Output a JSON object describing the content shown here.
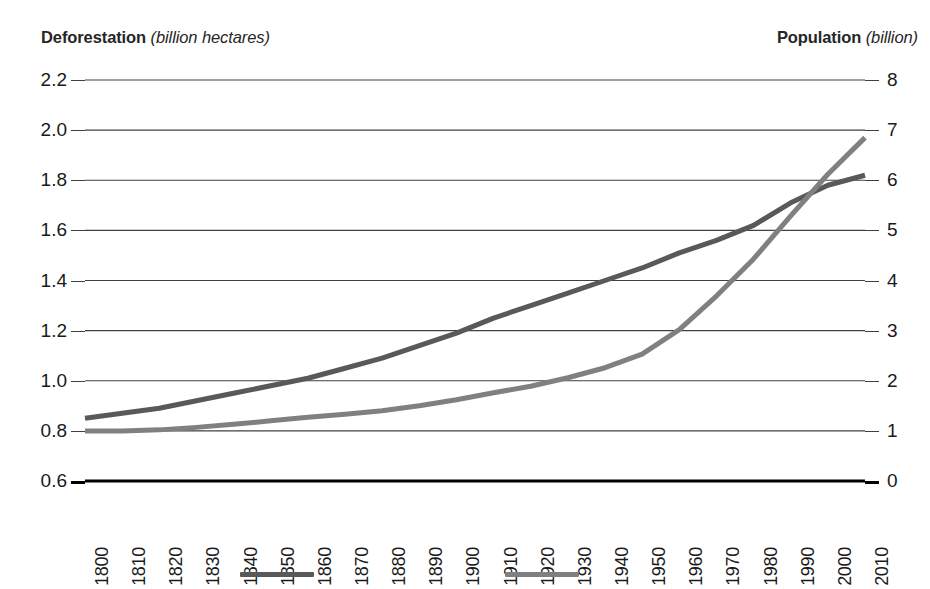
{
  "chart_data": {
    "type": "line",
    "title": "",
    "x": [
      1800,
      1810,
      1820,
      1830,
      1840,
      1850,
      1860,
      1870,
      1880,
      1890,
      1900,
      1910,
      1920,
      1930,
      1940,
      1950,
      1960,
      1970,
      1980,
      1990,
      2000,
      2010
    ],
    "categories": [
      "1800",
      "1810",
      "1820",
      "1830",
      "1840",
      "1850",
      "1860",
      "1870",
      "1880",
      "1890",
      "1900",
      "1910",
      "1920",
      "1930",
      "1940",
      "1950",
      "1960",
      "1970",
      "1980",
      "1990",
      "2000",
      "2010"
    ],
    "xlabel": "",
    "grid": true,
    "legend_position": "bottom",
    "series": [
      {
        "name": "Deforestation",
        "axis": "left",
        "color": "#595959",
        "unit": "billion hectares",
        "values": [
          0.85,
          0.87,
          0.89,
          0.92,
          0.95,
          0.98,
          1.01,
          1.05,
          1.09,
          1.14,
          1.19,
          1.25,
          1.3,
          1.35,
          1.4,
          1.45,
          1.51,
          1.56,
          1.62,
          1.71,
          1.78,
          1.82
        ]
      },
      {
        "name": "Population",
        "axis": "right",
        "color": "#808080",
        "unit": "billion",
        "values": [
          1.0,
          1.0,
          1.02,
          1.07,
          1.13,
          1.2,
          1.27,
          1.33,
          1.4,
          1.5,
          1.62,
          1.76,
          1.89,
          2.06,
          2.26,
          2.53,
          3.02,
          3.69,
          4.43,
          5.29,
          6.12,
          6.85
        ]
      }
    ],
    "left_axis": {
      "label_strong": "Deforestation",
      "label_unit": "(billion hectares)",
      "ticks": [
        "0.6",
        "0.8",
        "1.0",
        "1.2",
        "1.4",
        "1.6",
        "1.8",
        "2.0",
        "2.2"
      ],
      "ylim": [
        0.6,
        2.2
      ],
      "step": 0.2
    },
    "right_axis": {
      "label_strong": "Population",
      "label_unit": "(billion)",
      "ticks": [
        "0",
        "1",
        "2",
        "3",
        "4",
        "5",
        "6",
        "7",
        "8"
      ],
      "ylim": [
        0,
        8
      ],
      "step": 1
    },
    "legend": [
      {
        "swatch_name": "legend-swatch-deforestation",
        "color": "#595959",
        "label": ""
      },
      {
        "swatch_name": "legend-swatch-population",
        "color": "#808080",
        "label": ""
      }
    ],
    "style": {
      "gridline_color": "#404040",
      "axis_line_color": "#000000",
      "background": "#ffffff",
      "line_width_px": 5
    }
  }
}
